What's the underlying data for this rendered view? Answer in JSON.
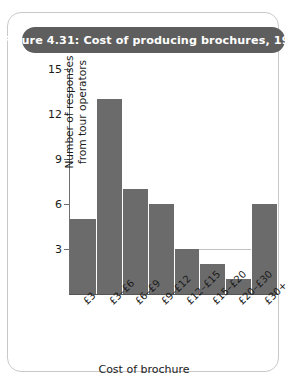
{
  "figure": {
    "title": "Figure 4.31: Cost of producing brochures, 1998",
    "title_bar_color": "#5e5e5e",
    "frame_border_color": "#c9c9c9"
  },
  "chart_data": {
    "type": "bar",
    "title": "Figure 4.31: Cost of producing brochures, 1998",
    "categories": [
      "£3",
      "£3–£6",
      "£6–£9",
      "£9–£12",
      "£12–£15",
      "£15–£20",
      "£20–£30",
      "£30+"
    ],
    "values": [
      5,
      13,
      7,
      6,
      3,
      2,
      1,
      6
    ],
    "xlabel": "Cost of brochure",
    "ylabel": "Number of responses from tour operators",
    "ylabel_line1": "Number of responses",
    "ylabel_line2": "from tour operators",
    "ylim": [
      0,
      15
    ],
    "yticks": [
      3,
      6,
      9,
      12,
      15
    ],
    "ytick_labels": [
      "3",
      "6",
      "9",
      "12",
      "15"
    ],
    "grid": true,
    "legend": "none",
    "bar_color": "#6b6b6b"
  }
}
